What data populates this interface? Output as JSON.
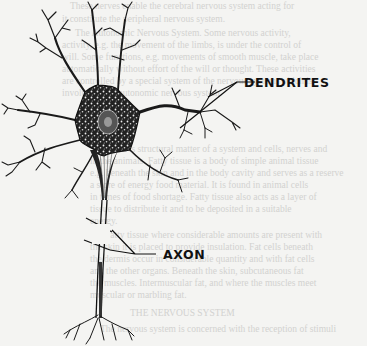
{
  "figure": {
    "labels": {
      "dendrites": "DENDRITES",
      "axon": "AXON"
    }
  },
  "bleed_through_text": [
    "These nerves enable the cerebral nervous system acting for",
    "it constitute the peripheral nervous system.",
    "The Autonomic Nervous System. Some nervous activity,",
    "activity, e.g. the movement of the limbs, is under the control of",
    "will. Some functions, e.g. movements of smooth muscle, take place",
    "automatically without effort of the will or thought. These activities",
    "are controlled by a special system of the nervous system, which is",
    "involuntary or autonomic nervous system.",
    "But it is structural matter of a system and cells, nerves and",
    "in the animals. Fatty tissue is a body of simple animal tissue",
    "e.g. beneath the skin and in the body cavity and serves as a reserve",
    "a store of energy food material. It is found in animal cells",
    "in times of food shortage. Fatty tissue also acts as a layer of",
    "tissue to distribute it and to be deposited in a suitable",
    "energy.",
    "Fatty tissue where considerable amounts are present with",
    "the skin it is placed to provide insulation. Fat cells beneath",
    "the dermis occur in considerable quantity and with fat cells",
    "and the other organs. Beneath the skin, subcutaneous fat",
    "the muscles. Intermuscular fat, and where the muscles meet",
    "muscular or marbling fat.",
    "THE NERVOUS SYSTEM",
    "The nervous system is concerned with the reception of stimuli"
  ]
}
